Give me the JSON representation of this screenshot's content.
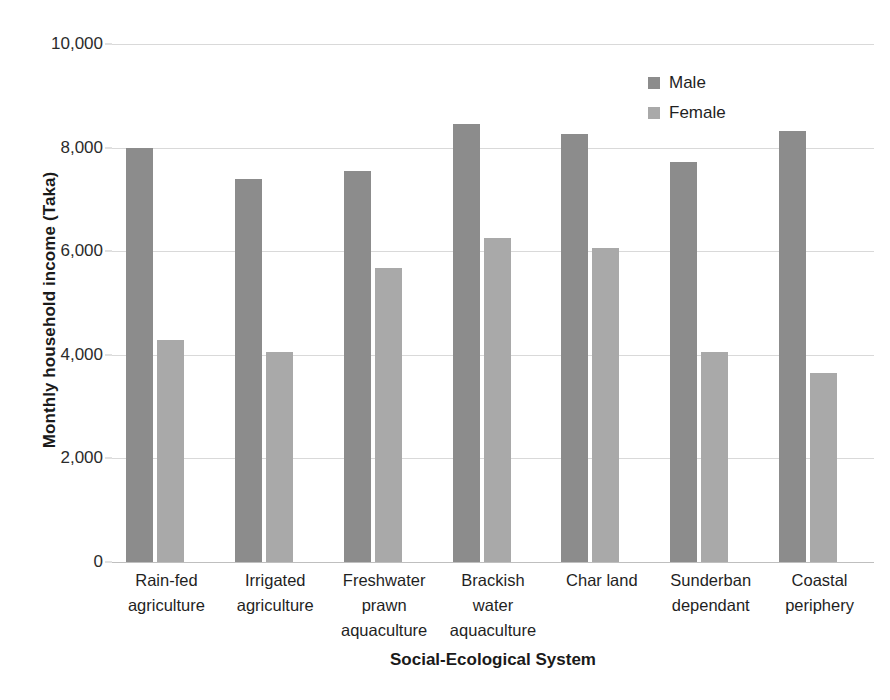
{
  "chart_data": {
    "type": "bar",
    "title": "",
    "xlabel": "Social-Ecological System",
    "ylabel": "Monthly household income (Taka)",
    "categories": [
      "Rain-fed agriculture",
      "Irrigated agriculture",
      "Freshwater prawn aquaculture",
      "Brackish water aquaculture",
      "Char land",
      "Sunderban dependant",
      "Coastal periphery"
    ],
    "category_lines": [
      [
        "Rain-fed",
        "agriculture"
      ],
      [
        "Irrigated",
        "agriculture"
      ],
      [
        "Freshwater",
        "prawn",
        "aquaculture"
      ],
      [
        "Brackish",
        "water",
        "aquaculture"
      ],
      [
        "Char land"
      ],
      [
        "Sunderban",
        "dependant"
      ],
      [
        "Coastal",
        "periphery"
      ]
    ],
    "series": [
      {
        "name": "Male",
        "color": "#8c8c8c",
        "values": [
          8000,
          7400,
          7550,
          8450,
          8260,
          7730,
          8330
        ]
      },
      {
        "name": "Female",
        "color": "#a9a9a9",
        "values": [
          4290,
          4050,
          5680,
          6250,
          6060,
          4060,
          3650
        ]
      }
    ],
    "ylim": [
      0,
      10000
    ],
    "ytick_values": [
      0,
      2000,
      4000,
      6000,
      8000,
      10000
    ],
    "ytick_labels": [
      "0",
      "2,000",
      "4,000",
      "6,000",
      "8,000",
      "10,000"
    ],
    "grid": true,
    "legend_position": "top-right"
  },
  "axes": {
    "y_title": "Monthly household income (Taka)",
    "x_title": "Social-Ecological System"
  },
  "legend": {
    "items": [
      {
        "label": "Male",
        "color": "#8c8c8c"
      },
      {
        "label": "Female",
        "color": "#a9a9a9"
      }
    ]
  }
}
